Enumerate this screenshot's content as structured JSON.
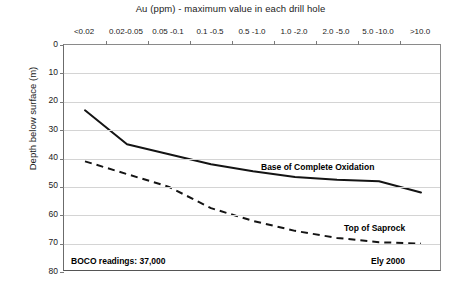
{
  "chart_data": {
    "type": "line",
    "title": "Au (ppm) - maximum value in each drill hole",
    "xlabel": "Au (ppm) - maximum value in each drill hole",
    "ylabel": "Depth below surface (m)",
    "categories": [
      "<0.02",
      "0.02-0.05",
      "0.05 -0.1",
      "0.1 -0.5",
      "0.5 -1.0",
      "1.0 -2.0",
      "2.0 -5.0",
      "5.0 -10.0",
      ">10.0"
    ],
    "ylim": [
      0,
      80
    ],
    "yticks": [
      0,
      10,
      20,
      30,
      40,
      50,
      60,
      70,
      80
    ],
    "y_axis_inverted": true,
    "x_axis_position": "top",
    "grid": true,
    "legend": "annotations-inline",
    "series": [
      {
        "name": "Base of Complete Oxidation",
        "style": "solid",
        "values": [
          23.0,
          35.0,
          38.5,
          42.0,
          44.5,
          46.5,
          47.5,
          48.0,
          52.0
        ]
      },
      {
        "name": "Top of Saprock",
        "style": "dashed",
        "values": [
          41.0,
          45.5,
          50.0,
          57.5,
          62.0,
          65.5,
          68.0,
          69.5,
          70.0
        ]
      }
    ],
    "annotations": [
      {
        "text": "Base of Complete Oxidation",
        "series": "Base of Complete Oxidation"
      },
      {
        "text": "Top of Saprock",
        "series": "Top of Saprock"
      }
    ],
    "footnotes": {
      "left": "BOCO readings: 37,000",
      "right": "Ely 2000"
    },
    "colors": {
      "line": "#141414",
      "grid": "#d4d4d4",
      "axis": "#6b6b6b",
      "text": "#1a1a1a"
    }
  }
}
